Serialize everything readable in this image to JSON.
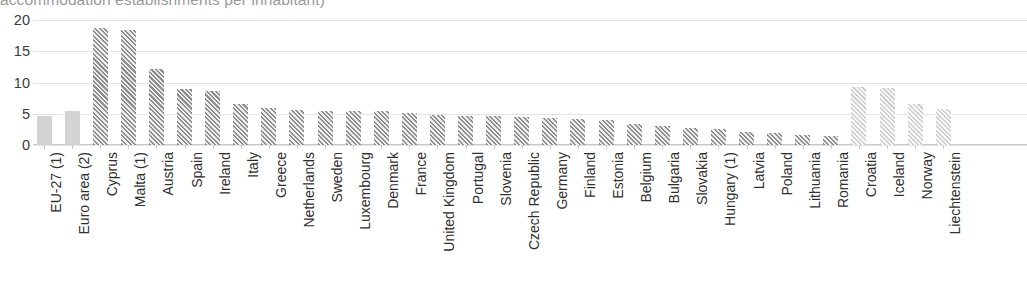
{
  "chart_data": {
    "type": "bar",
    "title": "accommodation establishments per inhabitant)",
    "xlabel": "",
    "ylabel": "",
    "ylim": [
      0,
      20
    ],
    "yticks": [
      0,
      5,
      10,
      15,
      20
    ],
    "grid": true,
    "legend": "none",
    "categories": [
      "EU-27 (1)",
      "Euro area (2)",
      "Cyprus",
      "Malta (1)",
      "Austria",
      "Spain",
      "Ireland",
      "Italy",
      "Greece",
      "Netherlands",
      "Sweden",
      "Luxembourg",
      "Denmark",
      "France",
      "United Kingdom",
      "Portugal",
      "Slovenia",
      "Czech Republic",
      "Germany",
      "Finland",
      "Estonia",
      "Belgium",
      "Bulgaria",
      "Slovakia",
      "Hungary (1)",
      "Latvia",
      "Poland",
      "Lithuania",
      "Romania",
      "Croatia",
      "Iceland",
      "Norway",
      "Liechtenstein"
    ],
    "values": [
      4.6,
      5.5,
      18.7,
      18.4,
      12.2,
      8.9,
      8.7,
      6.5,
      6.0,
      5.6,
      5.5,
      5.4,
      5.4,
      5.1,
      4.8,
      4.7,
      4.6,
      4.5,
      4.3,
      4.1,
      4.0,
      3.3,
      3.1,
      2.8,
      2.5,
      2.1,
      2.0,
      1.6,
      1.5,
      9.3,
      9.2,
      6.5,
      5.7
    ],
    "bar_styles": [
      "solid-light",
      "solid-light",
      "hatch-dark",
      "hatch-dark",
      "hatch-dark",
      "hatch-dark",
      "hatch-dark",
      "hatch-dark",
      "hatch-dark",
      "hatch-dark",
      "hatch-dark",
      "hatch-dark",
      "hatch-dark",
      "hatch-dark",
      "hatch-dark",
      "hatch-dark",
      "hatch-dark",
      "hatch-dark",
      "hatch-dark",
      "hatch-dark",
      "hatch-dark",
      "hatch-dark",
      "hatch-dark",
      "hatch-dark",
      "hatch-dark",
      "hatch-dark",
      "hatch-dark",
      "hatch-dark",
      "hatch-dark",
      "hatch-light",
      "hatch-light",
      "hatch-light",
      "hatch-light"
    ],
    "colors": {
      "aggregate_bar": "#d3d3d3",
      "member_state_bar": "#8d8d8d",
      "non_member_bar": "#cfcfcf",
      "gridline": "#e4e4e4",
      "axis": "#c9c9c9",
      "tick_label": "#3b3b3b",
      "category_label": "#2f2f2f",
      "title": "#9a9a9a"
    }
  }
}
